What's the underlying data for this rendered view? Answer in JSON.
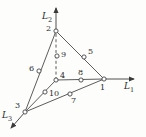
{
  "figure": {
    "type": "triangular-element-diagram",
    "background_color": "#fdfdfc",
    "line_color": "#4a4a4a",
    "node_fill": "#ffffff",
    "text_color": "#2b2b2b"
  },
  "axes": [
    {
      "id": "L1",
      "label": "L",
      "subscript": "1",
      "direction": "right",
      "origin_node": "1"
    },
    {
      "id": "L2",
      "label": "L",
      "subscript": "2",
      "direction": "up",
      "origin_node": "2"
    },
    {
      "id": "L3",
      "label": "L",
      "subscript": "3",
      "direction": "down-left",
      "origin_node": "3"
    }
  ],
  "nodes": [
    {
      "id": "1",
      "label": "1",
      "x": 104,
      "y": 79,
      "label_dx": -2,
      "label_dy": 7,
      "kind": "vertex"
    },
    {
      "id": "2",
      "label": "2",
      "x": 56,
      "y": 31,
      "label_dx": -9,
      "label_dy": -4,
      "kind": "vertex"
    },
    {
      "id": "3",
      "label": "3",
      "x": 25,
      "y": 112,
      "label_dx": -9,
      "label_dy": -8,
      "kind": "vertex"
    },
    {
      "id": "4",
      "label": "4",
      "x": 56,
      "y": 80,
      "label_dx": 4,
      "label_dy": -6,
      "kind": "interior"
    },
    {
      "id": "5",
      "label": "5",
      "x": 84,
      "y": 57,
      "label_dx": 4,
      "label_dy": -7,
      "kind": "midside"
    },
    {
      "id": "6",
      "label": "6",
      "x": 39,
      "y": 71,
      "label_dx": -9,
      "label_dy": -5,
      "kind": "midside"
    },
    {
      "id": "7",
      "label": "7",
      "x": 70,
      "y": 94,
      "label_dx": 1,
      "label_dy": 4,
      "kind": "midside"
    },
    {
      "id": "8",
      "label": "8",
      "x": 81,
      "y": 80,
      "label_dx": -2,
      "label_dy": -11,
      "kind": "interior-edge"
    },
    {
      "id": "9",
      "label": "9",
      "x": 57,
      "y": 56,
      "label_dx": 4,
      "label_dy": -5,
      "kind": "interior-edge"
    },
    {
      "id": "10",
      "label": "10",
      "x": 45,
      "y": 92,
      "label_dx": 4,
      "label_dy": -2,
      "kind": "interior-edge"
    }
  ],
  "edges": [
    {
      "from": "2",
      "to": "1",
      "style": "solid"
    },
    {
      "from": "2",
      "to": "3",
      "style": "solid"
    },
    {
      "from": "3",
      "to": "1",
      "style": "solid"
    },
    {
      "from": "4",
      "to": "1",
      "style": "solid"
    },
    {
      "from": "4",
      "to": "3",
      "style": "solid"
    },
    {
      "from": "4",
      "to": "2",
      "style": "dashed"
    }
  ]
}
